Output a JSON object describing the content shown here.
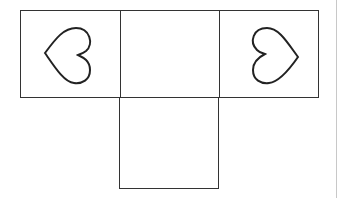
{
  "diagram": {
    "type": "cube-net-partial",
    "cells": [
      {
        "position": "top-left",
        "symbol": "heart",
        "orientation": "pointing-left"
      },
      {
        "position": "top-middle",
        "symbol": "none"
      },
      {
        "position": "top-right",
        "symbol": "heart",
        "orientation": "pointing-right"
      },
      {
        "position": "bottom-middle",
        "symbol": "none"
      }
    ],
    "colors": {
      "line": "#333333",
      "background": "#ffffff"
    }
  }
}
